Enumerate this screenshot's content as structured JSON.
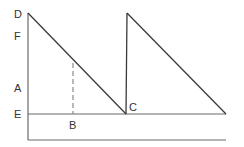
{
  "diagram": {
    "labels": {
      "D": "D",
      "F": "F",
      "A": "A",
      "E": "E",
      "B": "B",
      "C": "C"
    },
    "points": {
      "D": [
        28,
        13
      ],
      "C": [
        126,
        114
      ],
      "peak2": [
        127,
        13
      ],
      "end2": [
        226,
        114
      ],
      "B": [
        73,
        114
      ],
      "dash_top": [
        73,
        63
      ]
    },
    "colors": {
      "line": "#3a3a3a",
      "axis": "#6a6a6a",
      "dashed": "#8a8a8a",
      "text": "#333333"
    }
  }
}
